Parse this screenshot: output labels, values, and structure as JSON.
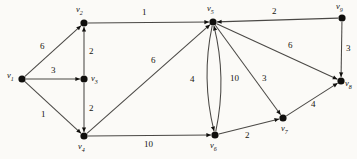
{
  "diagram": {
    "type": "directed-weighted-graph",
    "background_color": "#fbfaf7",
    "node_color": "#100f0d",
    "edge_color": "#4a4845",
    "nodes": [
      {
        "id": "v1",
        "label": "v",
        "sub": "1",
        "x": 22,
        "y": 79,
        "lx": 7,
        "ly": 71
      },
      {
        "id": "v2",
        "label": "v",
        "sub": "2",
        "x": 84,
        "y": 23,
        "lx": 76,
        "ly": 5
      },
      {
        "id": "v3",
        "label": "v",
        "sub": "3",
        "x": 84,
        "y": 79,
        "lx": 91,
        "ly": 74
      },
      {
        "id": "v4",
        "label": "v",
        "sub": "4",
        "x": 84,
        "y": 136,
        "lx": 78,
        "ly": 142
      },
      {
        "id": "v5",
        "label": "v",
        "sub": "5",
        "x": 213,
        "y": 22,
        "lx": 207,
        "ly": 4
      },
      {
        "id": "v6",
        "label": "v",
        "sub": "6",
        "x": 215,
        "y": 135,
        "lx": 210,
        "ly": 141
      },
      {
        "id": "v7",
        "label": "v",
        "sub": "7",
        "x": 283,
        "y": 118,
        "lx": 281,
        "ly": 124
      },
      {
        "id": "v8",
        "label": "v",
        "sub": "8",
        "x": 341,
        "y": 81,
        "lx": 345,
        "ly": 79
      },
      {
        "id": "v9",
        "label": "v",
        "sub": "9",
        "x": 342,
        "y": 18,
        "lx": 336,
        "ly": 2
      }
    ],
    "edges": [
      {
        "id": "e-v1-v2",
        "from": "v1",
        "to": "v2",
        "weight": "6",
        "shape": "line",
        "wx": 40,
        "wy": 42
      },
      {
        "id": "e-v1-v3",
        "from": "v1",
        "to": "v3",
        "weight": "3",
        "shape": "line",
        "wx": 51,
        "wy": 66
      },
      {
        "id": "e-v1-v4",
        "from": "v1",
        "to": "v4",
        "weight": "1",
        "shape": "line",
        "wx": 41,
        "wy": 110
      },
      {
        "id": "e-v3-v2",
        "from": "v3",
        "to": "v2",
        "weight": "2",
        "shape": "line",
        "wx": 89,
        "wy": 47
      },
      {
        "id": "e-v3-v4",
        "from": "v3",
        "to": "v4",
        "weight": "2",
        "shape": "line",
        "wx": 89,
        "wy": 104
      },
      {
        "id": "e-v2-v5",
        "from": "v2",
        "to": "v5",
        "weight": "1",
        "shape": "line",
        "wx": 142,
        "wy": 8
      },
      {
        "id": "e-v4-v5",
        "from": "v4",
        "to": "v5",
        "weight": "6",
        "shape": "line",
        "wx": 151,
        "wy": 56
      },
      {
        "id": "e-v4-v6",
        "from": "v4",
        "to": "v6",
        "weight": "10",
        "shape": "line",
        "wx": 144,
        "wy": 140
      },
      {
        "id": "e-v5-v6",
        "from": "v5",
        "to": "v6",
        "weight": "4",
        "shape": "curve-left",
        "wx": 190,
        "wy": 75
      },
      {
        "id": "e-v6-v5",
        "from": "v6",
        "to": "v5",
        "weight": "10",
        "shape": "curve-right",
        "wx": 230,
        "wy": 74
      },
      {
        "id": "e-v5-v7",
        "from": "v5",
        "to": "v7",
        "weight": "3",
        "shape": "line",
        "wx": 262,
        "wy": 74
      },
      {
        "id": "e-v5-v8",
        "from": "v5",
        "to": "v8",
        "weight": "6",
        "shape": "line",
        "wx": 288,
        "wy": 41
      },
      {
        "id": "e-v6-v7",
        "from": "v6",
        "to": "v7",
        "weight": "2",
        "shape": "line",
        "wx": 245,
        "wy": 131
      },
      {
        "id": "e-v7-v8",
        "from": "v7",
        "to": "v8",
        "weight": "4",
        "shape": "line",
        "wx": 311,
        "wy": 100
      },
      {
        "id": "e-v9-v5",
        "from": "v9",
        "to": "v5",
        "weight": "2",
        "shape": "line",
        "wx": 272,
        "wy": 7
      },
      {
        "id": "e-v9-v8",
        "from": "v9",
        "to": "v8",
        "weight": "3",
        "shape": "line",
        "wx": 346,
        "wy": 44
      }
    ]
  }
}
